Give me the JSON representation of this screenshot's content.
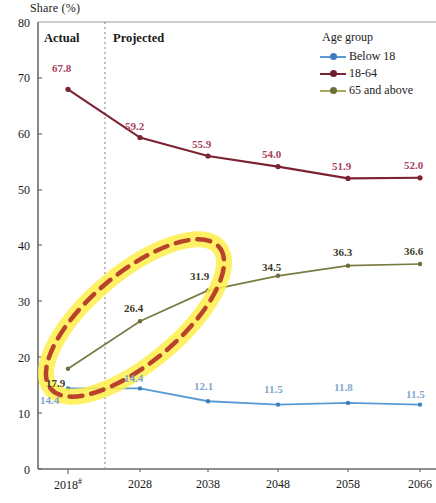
{
  "chart_data": {
    "type": "line",
    "title": "",
    "ylabel": "Share (%)",
    "xlabel": "",
    "categories": [
      "2018",
      "2028",
      "2038",
      "2048",
      "2058",
      "2066"
    ],
    "x_tick_superscripts": [
      "#",
      "",
      "",
      "",
      "",
      ""
    ],
    "ylim": [
      0,
      80
    ],
    "y_ticks": [
      0,
      10,
      20,
      30,
      40,
      50,
      60,
      70,
      80
    ],
    "grid": false,
    "legend_position": "top-right",
    "legend_title": "Age group",
    "series": [
      {
        "name": "Below 18",
        "color": "#5b9bd5",
        "values": [
          14.4,
          14.4,
          12.1,
          11.5,
          11.8,
          11.5
        ],
        "labels": [
          "14.4",
          "14.4",
          "12.1",
          "11.5",
          "11.8",
          "11.5"
        ]
      },
      {
        "name": "18-64",
        "color": "#7b2233",
        "values": [
          67.8,
          59.2,
          55.9,
          54.0,
          51.9,
          52.0
        ],
        "labels": [
          "67.8",
          "59.2",
          "55.9",
          "54.0",
          "51.9",
          "52.0"
        ]
      },
      {
        "name": "65 and above",
        "color": "#7a7a43",
        "values": [
          17.9,
          26.4,
          31.9,
          34.5,
          36.3,
          36.6
        ],
        "labels": [
          "17.9",
          "26.4",
          "31.9",
          "34.5",
          "36.3",
          "36.6"
        ]
      }
    ],
    "annotations": [
      {
        "text": "Actual",
        "type": "region-label"
      },
      {
        "text": "Projected",
        "type": "region-label"
      },
      {
        "text": "",
        "type": "highlight-ellipse",
        "color": "#c0392b",
        "glow": "#ffef4d"
      }
    ],
    "divider": {
      "after_category": "2018",
      "style": "dotted"
    }
  },
  "axis": {
    "y_title": "Share (%)",
    "y_ticks": [
      "80",
      "70",
      "60",
      "50",
      "40",
      "30",
      "20",
      "10",
      "0"
    ],
    "x_ticks": [
      "2018",
      "2028",
      "2038",
      "2048",
      "2058",
      "2066"
    ],
    "x_tick_mark": "#"
  },
  "regions": {
    "actual": "Actual",
    "projected": "Projected"
  },
  "legend": {
    "title": "Age group",
    "items": [
      {
        "label": "Below 18",
        "color": "#5b9bd5"
      },
      {
        "label": "18-64",
        "color": "#7b2233"
      },
      {
        "label": "65 and above",
        "color": "#7a7a43"
      }
    ]
  },
  "labels": {
    "s1864": [
      "67.8",
      "59.2",
      "55.9",
      "54.0",
      "51.9",
      "52.0"
    ],
    "s65": [
      "17.9",
      "26.4",
      "31.9",
      "34.5",
      "36.3",
      "36.6"
    ],
    "sbelow": [
      "14.4",
      "14.4",
      "12.1",
      "11.5",
      "11.8",
      "11.5"
    ]
  }
}
